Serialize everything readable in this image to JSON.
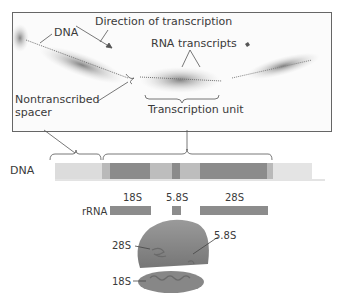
{
  "photo": {
    "labels": {
      "dna": "DNA",
      "direction": "Direction of transcription",
      "rna_transcripts": "RNA transcripts",
      "nontranscribed_1": "Nontranscribed",
      "nontranscribed_2": "spacer",
      "transcription_unit": "Transcription unit"
    }
  },
  "gene_map": {
    "dna_label": "DNA",
    "rrna_label": "rRNA",
    "segments": [
      "18S",
      "5.8S",
      "28S"
    ]
  },
  "ribosome": {
    "labels": {
      "s28": "28S",
      "s58": "5.8S",
      "s18": "18S"
    }
  },
  "colors": {
    "coding": "#8c8c8c",
    "spacer_internal": "#bdbdbd",
    "nontranscribed": "#dedede",
    "ribosome": "#8f8f8f",
    "ribosome_dark": "#6f6f6f"
  }
}
